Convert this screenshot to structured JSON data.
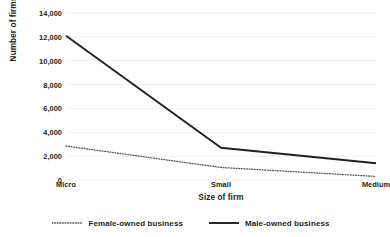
{
  "chart_data": {
    "type": "line",
    "title": "",
    "xlabel": "Size of firm",
    "ylabel": "Number of firms",
    "categories": [
      "Micro",
      "Small",
      "Medium"
    ],
    "series": [
      {
        "name": "Female-owned business",
        "style": "dotted",
        "color": "#5a5a5a",
        "values": [
          2850,
          1050,
          300
        ]
      },
      {
        "name": "Male-owned business",
        "style": "solid",
        "color": "#231f20",
        "values": [
          12100,
          2700,
          1400
        ]
      }
    ],
    "ylim": [
      0,
      14000
    ],
    "yticks": [
      0,
      2000,
      4000,
      6000,
      8000,
      10000,
      12000,
      14000
    ],
    "ytick_labels": [
      "0",
      "2,000",
      "4,000",
      "6,000",
      "8,000",
      "10,000",
      "12,000",
      "14,000"
    ],
    "grid": true,
    "grid_color": "#e8e8e8",
    "legend_position": "bottom",
    "background": "#ffffff"
  },
  "legend": {
    "items": [
      {
        "label": "Female-owned business"
      },
      {
        "label": "Male-owned business"
      }
    ]
  }
}
